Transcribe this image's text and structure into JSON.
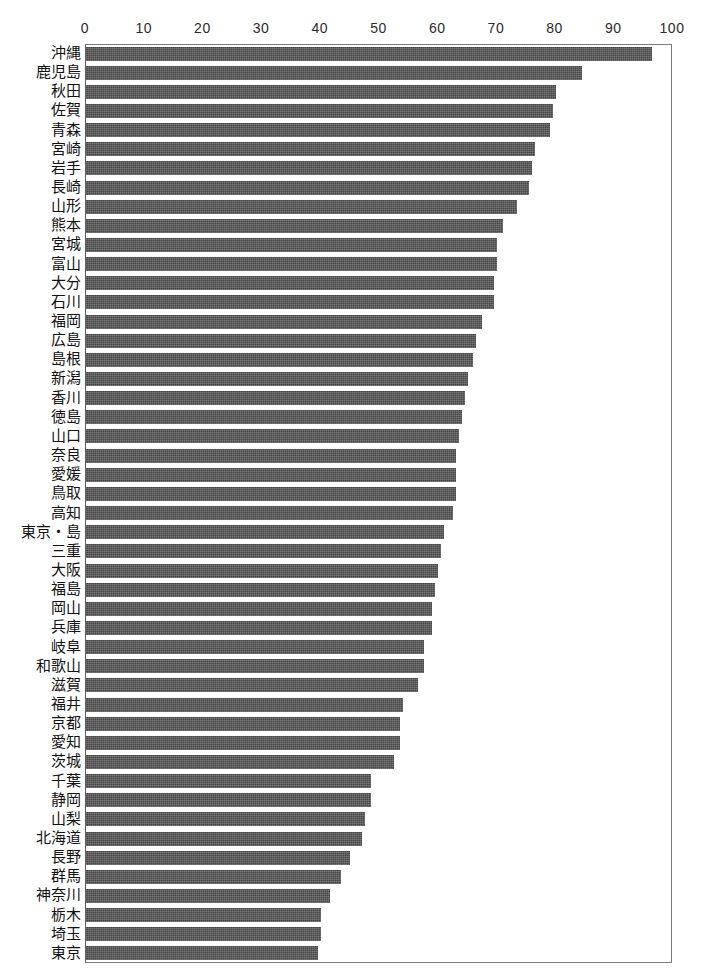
{
  "chart_data": {
    "type": "bar",
    "orientation": "horizontal",
    "title": "",
    "xlabel": "",
    "ylabel": "",
    "xlim": [
      0,
      100
    ],
    "xticks": [
      0,
      10,
      20,
      30,
      40,
      50,
      60,
      70,
      80,
      90,
      100
    ],
    "grid": false,
    "legend": null,
    "bar_color": "#454545",
    "frame_color": "#7a7a7a",
    "sorted": "descending",
    "categories": [
      "沖縄",
      "鹿児島",
      "秋田",
      "佐賀",
      "青森",
      "宮崎",
      "岩手",
      "長崎",
      "山形",
      "熊本",
      "宮城",
      "富山",
      "大分",
      "石川",
      "福岡",
      "広島",
      "島根",
      "新潟",
      "香川",
      "徳島",
      "山口",
      "奈良",
      "愛媛",
      "鳥取",
      "高知",
      "東京・島",
      "三重",
      "大阪",
      "福島",
      "岡山",
      "兵庫",
      "岐阜",
      "和歌山",
      "滋賀",
      "福井",
      "京都",
      "愛知",
      "茨城",
      "千葉",
      "静岡",
      "山梨",
      "北海道",
      "長野",
      "群馬",
      "神奈川",
      "栃木",
      "埼玉",
      "東京"
    ],
    "values": [
      96.5,
      84.5,
      80.0,
      79.5,
      79.0,
      76.5,
      76.0,
      75.5,
      73.5,
      71.0,
      70.0,
      70.0,
      69.5,
      69.5,
      67.5,
      66.5,
      66.0,
      65.0,
      64.5,
      64.0,
      63.5,
      63.0,
      63.0,
      63.0,
      62.5,
      61.0,
      60.5,
      60.0,
      59.5,
      59.0,
      59.0,
      57.5,
      57.5,
      56.5,
      54.0,
      53.5,
      53.5,
      52.5,
      48.5,
      48.5,
      47.5,
      47.0,
      45.0,
      43.5,
      41.5,
      40.0,
      40.0,
      39.5
    ]
  }
}
